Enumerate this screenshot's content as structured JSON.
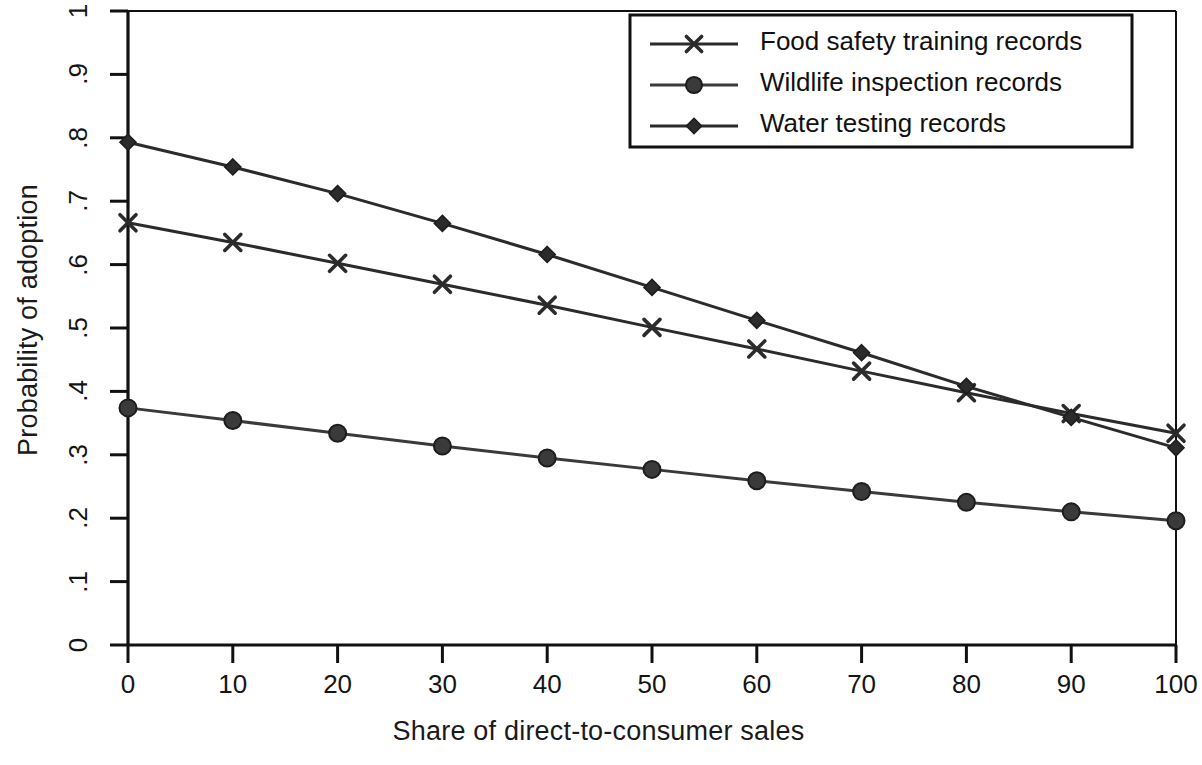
{
  "chart_data": {
    "type": "line",
    "title": "",
    "subtitle": "",
    "xlabel": "Share of direct-to-consumer sales",
    "ylabel": "Probability of adoption",
    "xlim": [
      0,
      100
    ],
    "ylim": [
      0,
      1
    ],
    "grid": false,
    "legend_position": "top-right",
    "xticks": [
      "0",
      "10",
      "20",
      "30",
      "40",
      "50",
      "60",
      "70",
      "80",
      "90",
      "100"
    ],
    "yticks": [
      "0",
      ".1",
      ".2",
      ".3",
      ".4",
      ".5",
      ".6",
      ".7",
      ".8",
      ".9",
      "1"
    ],
    "x": [
      0,
      10,
      20,
      30,
      40,
      50,
      60,
      70,
      80,
      90,
      100
    ],
    "series": [
      {
        "name": "Food safety training records",
        "marker": "x-cross",
        "color": "#2b2b2b",
        "values": [
          0.666,
          0.635,
          0.602,
          0.569,
          0.536,
          0.501,
          0.467,
          0.432,
          0.398,
          0.365,
          0.334
        ]
      },
      {
        "name": "Wildlife inspection records",
        "marker": "circle",
        "color": "#3a3a3a",
        "values": [
          0.374,
          0.354,
          0.334,
          0.314,
          0.295,
          0.277,
          0.259,
          0.242,
          0.225,
          0.21,
          0.196
        ]
      },
      {
        "name": "Water testing records",
        "marker": "diamond",
        "color": "#2b2b2b",
        "values": [
          0.793,
          0.754,
          0.712,
          0.665,
          0.616,
          0.564,
          0.512,
          0.461,
          0.408,
          0.359,
          0.311
        ]
      }
    ]
  },
  "legend": {
    "entries": [
      {
        "label": "Food safety training records"
      },
      {
        "label": "Wildlife inspection records"
      },
      {
        "label": "Water testing records"
      }
    ]
  },
  "axes": {
    "x_title": "Share of direct-to-consumer sales",
    "y_title": "Probability of adoption"
  }
}
